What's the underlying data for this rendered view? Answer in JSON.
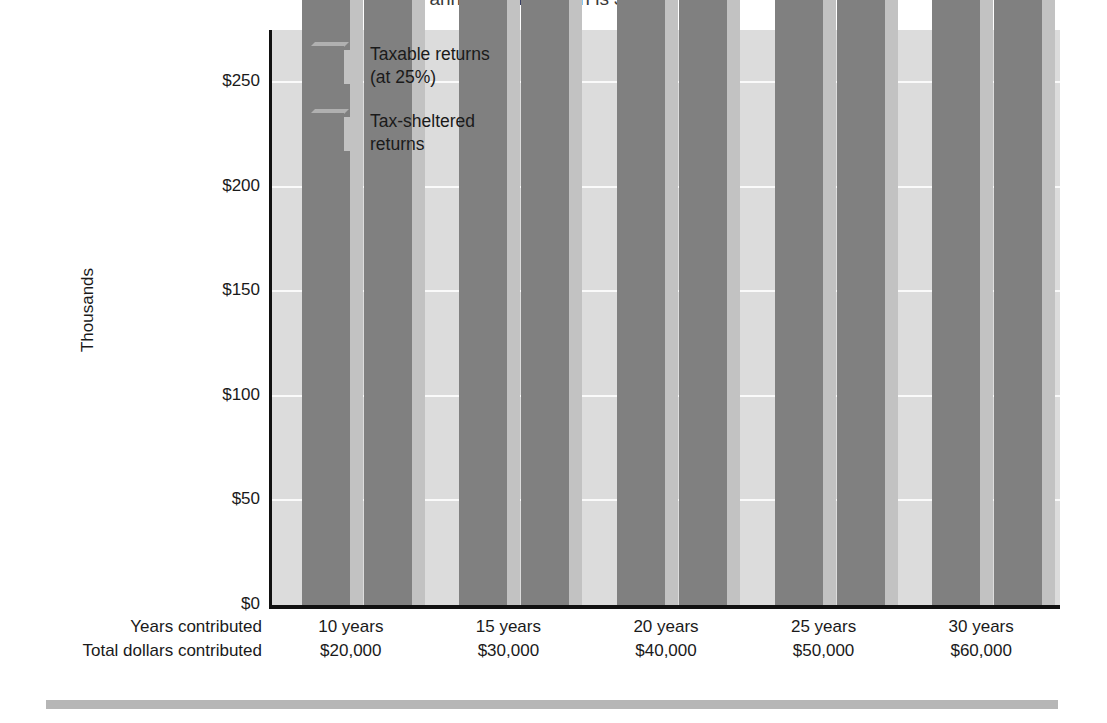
{
  "chart_data": {
    "type": "bar",
    "title": "annual contribution is $2,000.",
    "xlabel": "",
    "ylabel": "Thousands",
    "ylim": [
      0,
      275
    ],
    "yticks": [
      0,
      50,
      100,
      150,
      200,
      250
    ],
    "ytick_labels": [
      "$0",
      "$50",
      "$100",
      "$150",
      "$200",
      "$250"
    ],
    "grid": true,
    "legend_position": "upper-left-inside",
    "categories": [
      "10 years",
      "15 years",
      "20 years",
      "25 years",
      "30 years"
    ],
    "category_row_labels": {
      "years": "Years contributed",
      "dollars": "Total dollars contributed"
    },
    "category_sublabels": [
      "$20,000",
      "$30,000",
      "$40,000",
      "$50,000",
      "$60,000"
    ],
    "series": [
      {
        "name": "Taxable returns\n(at 25%)",
        "values": [
          27943,
          49345,
          77985,
          116313,
          167603
        ],
        "value_labels": [
          "$27,943",
          "$49,345",
          "$77,985",
          "$116,313",
          "$167,603"
        ],
        "color": "#808080"
      },
      {
        "name": "Tax-sheltered\nreturns",
        "values": [
          31920,
          58648,
          98846,
          157909,
          244691
        ],
        "value_labels": [
          "$31,920",
          "$58,648",
          "$98,846",
          "$157,909",
          "$244,691"
        ],
        "color": "#808080"
      }
    ]
  },
  "colors": {
    "bar_face": "#808080",
    "bar_side": "#c2c2c2",
    "plot_background": "#dcdcdc",
    "gridline": "#fafafa",
    "axis": "#111111",
    "bottom_rule": "#b6b6b6"
  }
}
